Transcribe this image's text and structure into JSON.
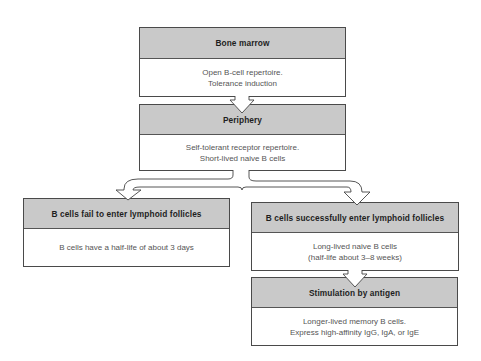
{
  "diagram": {
    "nodes": [
      {
        "id": "bone-marrow",
        "title": "Bone marrow",
        "lines": [
          "Open B-cell repertoire.",
          "Tolerance induction"
        ]
      },
      {
        "id": "periphery",
        "title": "Periphery",
        "lines": [
          "Self-tolerant receptor repertoire.",
          "Short-lived naive B cells"
        ]
      },
      {
        "id": "fail",
        "title": "B cells fail to enter lymphoid follicles",
        "lines": [
          "B cells have a half-life of about 3 days"
        ]
      },
      {
        "id": "success",
        "title": "B cells successfully enter lymphoid follicles",
        "lines": [
          "Long-lived naive B cells",
          "(half-life about 3–8 weeks)"
        ]
      },
      {
        "id": "stimulation",
        "title": "Stimulation by antigen",
        "lines": [
          "Longer-lived memory B cells.",
          "Express high-affinity IgG, IgA, or IgE"
        ]
      }
    ],
    "edges": [
      {
        "from": "bone-marrow",
        "to": "periphery"
      },
      {
        "from": "periphery",
        "to": "fail"
      },
      {
        "from": "periphery",
        "to": "success"
      },
      {
        "from": "success",
        "to": "stimulation"
      }
    ],
    "colors": {
      "header_fill": "#c9c9c9",
      "border": "#4a4a4a",
      "title_text": "#1e1e1e",
      "body_text": "#555555"
    }
  }
}
